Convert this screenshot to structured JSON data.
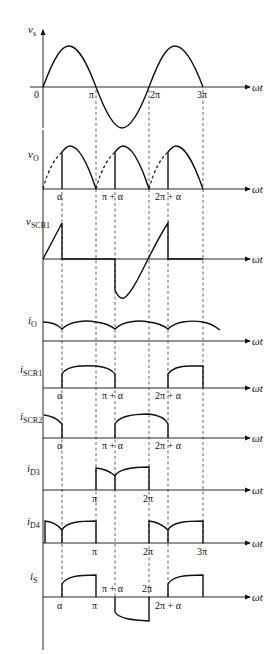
{
  "diagram": {
    "x_axis_label": "ωt",
    "vertical_axis_x": 43,
    "angle_positions": {
      "0": 43,
      "alpha": 62,
      "pi": 96,
      "pi_plus_alpha": 115,
      "2pi": 149,
      "2pi_plus_alpha": 168,
      "3pi": 203
    },
    "panels": [
      {
        "id": "vs",
        "label": "v",
        "subscript": "s",
        "axis_y": 87,
        "ticks": [
          "0",
          "π",
          "2π",
          "3π"
        ]
      },
      {
        "id": "vo",
        "label": "v",
        "subscript": "O",
        "axis_y": 189,
        "ticks": [
          "α",
          "π + α",
          "2π + α"
        ]
      },
      {
        "id": "vscr1",
        "label": "v",
        "subscript": "SCR1",
        "axis_y": 259,
        "ticks": []
      },
      {
        "id": "io",
        "label": "i",
        "subscript": "O",
        "axis_y": 321,
        "ticks": []
      },
      {
        "id": "iscr1",
        "label": "i",
        "subscript": "SCR1",
        "axis_y": 388,
        "ticks": [
          "α",
          "π + α",
          "2π + α"
        ]
      },
      {
        "id": "iscr2",
        "label": "i",
        "subscript": "SCR2",
        "axis_y": 438,
        "ticks": [
          "α",
          "π + α",
          "2π + α"
        ]
      },
      {
        "id": "id3",
        "label": "i",
        "subscript": "D3",
        "axis_y": 490,
        "ticks": [
          "π",
          "2π"
        ]
      },
      {
        "id": "id4",
        "label": "i",
        "subscript": "D4",
        "axis_y": 543,
        "ticks": [
          "π",
          "2π",
          "3π"
        ]
      },
      {
        "id": "is",
        "label": "i",
        "subscript": "S",
        "axis_y": 597,
        "ticks": [
          "α",
          "π",
          "π + α",
          "2π",
          "2π + α"
        ]
      }
    ],
    "tick_labels": {
      "zero": "0",
      "pi": "π",
      "two_pi": "2π",
      "three_pi": "3π",
      "alpha": "α",
      "pi_plus_alpha": "π + α",
      "two_pi_plus_alpha": "2π + α"
    }
  }
}
